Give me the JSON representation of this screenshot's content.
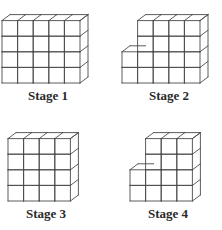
{
  "figure": {
    "line_color": "#4a4a4a",
    "cube_size": 15.6,
    "depth_dx": 8,
    "depth_dy": 6,
    "stages": [
      {
        "label": "Stage 1",
        "column_heights": [
          4,
          4,
          4,
          4,
          4
        ],
        "origin_x": 2,
        "base_y": 83,
        "label_x": 28,
        "label_y": 88
      },
      {
        "label": "Stage 2",
        "column_heights": [
          2,
          4,
          4,
          4,
          4
        ],
        "origin_x": 122,
        "base_y": 83,
        "label_x": 149,
        "label_y": 88
      },
      {
        "label": "Stage 3",
        "column_heights": [
          4,
          4,
          4,
          4
        ],
        "origin_x": 8,
        "base_y": 201,
        "label_x": 26,
        "label_y": 206
      },
      {
        "label": "Stage 4",
        "column_heights": [
          2,
          4,
          4,
          4
        ],
        "origin_x": 130,
        "base_y": 201,
        "label_x": 148,
        "label_y": 206
      }
    ]
  }
}
